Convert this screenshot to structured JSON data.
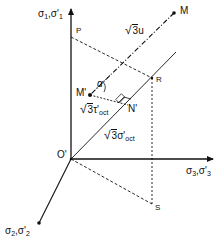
{
  "diagram": {
    "type": "stress-space-geometry",
    "axes": {
      "sigma1": {
        "label": "σ1,σ'1",
        "main": "σ",
        "sub1": "1",
        "sep": ",",
        "main2": "σ'",
        "sub2": "1"
      },
      "sigma2": {
        "label": "σ2,σ'2",
        "main": "σ",
        "sub1": "2",
        "sep": ",",
        "main2": "σ'",
        "sub2": "2"
      },
      "sigma3": {
        "label": "σ3,σ'3",
        "main": "σ",
        "sub1": "3",
        "sep": ",",
        "main2": "σ'",
        "sub2": "3"
      }
    },
    "points": {
      "origin": "O'",
      "M": "M",
      "M_prime": "M'",
      "N_prime": "N'",
      "P": "P",
      "R": "R",
      "S": "S"
    },
    "annotations": {
      "sqrt3u": {
        "radical": "√",
        "radicand": "3",
        "var": "u"
      },
      "sqrt3tau": {
        "radical": "√",
        "radicand": "3",
        "var": "τ'",
        "sub": "oct"
      },
      "sqrt3sigma": {
        "radical": "√",
        "radicand": "3",
        "var": "σ'",
        "sub": "oct"
      },
      "alpha": "α"
    },
    "colors": {
      "line": "#111111",
      "background": "#ffffff"
    }
  }
}
